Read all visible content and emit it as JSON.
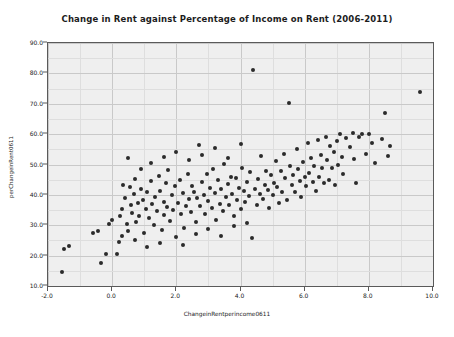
{
  "chart_data": {
    "type": "scatter",
    "title": "Change in Rent against Percentage of Income on Rent (2006-2011)",
    "xlabel": "ChangeinRentperincome0611",
    "ylabel": "perChangeinRent0611",
    "xlim": [
      -2.0,
      10.0
    ],
    "ylim": [
      10.0,
      90.0
    ],
    "xticks": [
      "-2.0",
      "0.0",
      "2.0",
      "4.0",
      "6.0",
      "8.0",
      "10.0"
    ],
    "xtick_values": [
      -2.0,
      0.0,
      2.0,
      4.0,
      6.0,
      8.0,
      10.0
    ],
    "yticks": [
      "10.0",
      "20.0",
      "30.0",
      "40.0",
      "50.0",
      "60.0",
      "70.0",
      "80.0",
      "90.0"
    ],
    "ytick_values": [
      10.0,
      20.0,
      30.0,
      40.0,
      50.0,
      60.0,
      70.0,
      80.0,
      90.0
    ],
    "x_minor_step": 1.0,
    "y_minor_step": 5.0,
    "grid": true,
    "legend": "none",
    "marker_color": "#2b2b2b",
    "plot_background": "#efefef",
    "figure_background": "#ffffff",
    "points": [
      [
        -1.55,
        14.6
      ],
      [
        -1.5,
        22.3
      ],
      [
        -1.35,
        23.2
      ],
      [
        -0.6,
        27.4
      ],
      [
        -0.45,
        28.0
      ],
      [
        -0.35,
        17.6
      ],
      [
        -0.2,
        20.6
      ],
      [
        -0.1,
        30.5
      ],
      [
        0.0,
        31.8
      ],
      [
        0.15,
        20.6
      ],
      [
        0.2,
        24.4
      ],
      [
        0.25,
        33.2
      ],
      [
        0.3,
        35.5
      ],
      [
        0.35,
        43.2
      ],
      [
        0.4,
        38.9
      ],
      [
        0.45,
        30.3
      ],
      [
        0.5,
        28.2
      ],
      [
        0.55,
        42.6
      ],
      [
        0.6,
        36.6
      ],
      [
        0.62,
        34.0
      ],
      [
        0.68,
        40.2
      ],
      [
        0.7,
        45.3
      ],
      [
        0.75,
        31.2
      ],
      [
        0.8,
        37.4
      ],
      [
        0.85,
        33.0
      ],
      [
        0.9,
        42.0
      ],
      [
        0.95,
        38.2
      ],
      [
        1.0,
        27.6
      ],
      [
        1.05,
        35.2
      ],
      [
        1.1,
        40.8
      ],
      [
        1.15,
        32.3
      ],
      [
        1.2,
        44.6
      ],
      [
        1.25,
        36.9
      ],
      [
        1.3,
        30.0
      ],
      [
        1.35,
        39.4
      ],
      [
        1.4,
        34.6
      ],
      [
        1.45,
        46.2
      ],
      [
        1.5,
        41.2
      ],
      [
        1.55,
        28.6
      ],
      [
        1.6,
        37.8
      ],
      [
        1.62,
        33.4
      ],
      [
        1.68,
        43.8
      ],
      [
        1.7,
        36.0
      ],
      [
        1.75,
        48.2
      ],
      [
        1.8,
        31.5
      ],
      [
        1.85,
        39.9
      ],
      [
        1.9,
        35.0
      ],
      [
        1.95,
        42.8
      ],
      [
        2.0,
        26.0
      ],
      [
        2.05,
        37.2
      ],
      [
        2.1,
        45.0
      ],
      [
        2.15,
        33.8
      ],
      [
        2.2,
        40.5
      ],
      [
        2.25,
        29.2
      ],
      [
        2.3,
        36.4
      ],
      [
        2.35,
        47.0
      ],
      [
        2.4,
        38.6
      ],
      [
        2.45,
        34.2
      ],
      [
        2.5,
        43.0
      ],
      [
        2.55,
        41.0
      ],
      [
        2.6,
        31.0
      ],
      [
        2.65,
        39.0
      ],
      [
        2.7,
        56.5
      ],
      [
        2.75,
        36.2
      ],
      [
        2.8,
        44.2
      ],
      [
        2.85,
        40.0
      ],
      [
        2.9,
        33.6
      ],
      [
        2.95,
        46.8
      ],
      [
        3.0,
        38.0
      ],
      [
        3.05,
        42.2
      ],
      [
        3.1,
        35.6
      ],
      [
        3.15,
        48.6
      ],
      [
        3.2,
        40.6
      ],
      [
        3.25,
        31.8
      ],
      [
        3.3,
        44.8
      ],
      [
        3.35,
        37.0
      ],
      [
        3.4,
        41.8
      ],
      [
        3.45,
        34.8
      ],
      [
        3.5,
        50.2
      ],
      [
        3.55,
        39.2
      ],
      [
        3.6,
        43.6
      ],
      [
        3.65,
        36.8
      ],
      [
        3.7,
        46.0
      ],
      [
        3.75,
        40.4
      ],
      [
        3.8,
        33.2
      ],
      [
        3.85,
        45.6
      ],
      [
        3.9,
        38.4
      ],
      [
        3.95,
        42.4
      ],
      [
        4.0,
        35.4
      ],
      [
        4.05,
        49.0
      ],
      [
        4.1,
        41.4
      ],
      [
        4.15,
        37.6
      ],
      [
        4.2,
        44.4
      ],
      [
        4.25,
        39.6
      ],
      [
        4.3,
        47.4
      ],
      [
        4.35,
        25.8
      ],
      [
        4.4,
        81.0
      ],
      [
        4.45,
        42.0
      ],
      [
        4.5,
        36.6
      ],
      [
        4.55,
        45.2
      ],
      [
        4.6,
        40.2
      ],
      [
        4.65,
        52.8
      ],
      [
        4.7,
        38.8
      ],
      [
        4.75,
        43.4
      ],
      [
        4.8,
        48.0
      ],
      [
        4.85,
        41.6
      ],
      [
        4.9,
        35.8
      ],
      [
        4.95,
        46.4
      ],
      [
        5.0,
        39.8
      ],
      [
        5.05,
        44.0
      ],
      [
        5.1,
        51.0
      ],
      [
        5.15,
        42.6
      ],
      [
        5.2,
        37.2
      ],
      [
        5.25,
        47.8
      ],
      [
        5.3,
        40.8
      ],
      [
        5.35,
        53.6
      ],
      [
        5.4,
        45.4
      ],
      [
        5.45,
        38.2
      ],
      [
        5.5,
        70.2
      ],
      [
        5.55,
        49.6
      ],
      [
        5.6,
        43.2
      ],
      [
        5.65,
        46.6
      ],
      [
        5.7,
        41.0
      ],
      [
        5.75,
        55.0
      ],
      [
        5.8,
        48.4
      ],
      [
        5.85,
        44.6
      ],
      [
        5.9,
        39.4
      ],
      [
        5.95,
        50.8
      ],
      [
        6.0,
        45.8
      ],
      [
        6.05,
        42.8
      ],
      [
        6.1,
        57.2
      ],
      [
        6.15,
        47.2
      ],
      [
        6.2,
        52.0
      ],
      [
        6.25,
        44.2
      ],
      [
        6.3,
        49.4
      ],
      [
        6.35,
        41.2
      ],
      [
        6.4,
        58.0
      ],
      [
        6.45,
        46.0
      ],
      [
        6.5,
        53.0
      ],
      [
        6.55,
        48.8
      ],
      [
        6.6,
        43.8
      ],
      [
        6.65,
        59.2
      ],
      [
        6.7,
        51.4
      ],
      [
        6.75,
        45.0
      ],
      [
        6.8,
        56.0
      ],
      [
        6.85,
        49.0
      ],
      [
        6.9,
        54.2
      ],
      [
        6.95,
        43.4
      ],
      [
        7.0,
        57.8
      ],
      [
        7.05,
        50.0
      ],
      [
        7.1,
        60.0
      ],
      [
        7.15,
        52.6
      ],
      [
        7.2,
        46.8
      ],
      [
        7.3,
        58.6
      ],
      [
        7.4,
        55.6
      ],
      [
        7.5,
        60.4
      ],
      [
        7.55,
        51.8
      ],
      [
        7.6,
        44.0
      ],
      [
        7.7,
        59.0
      ],
      [
        7.8,
        60.2
      ],
      [
        7.9,
        53.4
      ],
      [
        8.0,
        60.0
      ],
      [
        8.1,
        57.0
      ],
      [
        8.2,
        50.6
      ],
      [
        8.4,
        58.4
      ],
      [
        8.5,
        67.0
      ],
      [
        8.6,
        52.8
      ],
      [
        8.65,
        56.2
      ],
      [
        9.6,
        74.0
      ],
      [
        0.5,
        52.0
      ],
      [
        0.9,
        48.6
      ],
      [
        1.2,
        50.4
      ],
      [
        1.6,
        52.4
      ],
      [
        2.0,
        54.0
      ],
      [
        2.4,
        51.6
      ],
      [
        2.8,
        53.2
      ],
      [
        3.2,
        55.4
      ],
      [
        3.6,
        52.2
      ],
      [
        4.0,
        56.8
      ],
      [
        1.1,
        22.8
      ],
      [
        1.5,
        24.2
      ],
      [
        2.2,
        23.6
      ],
      [
        2.6,
        27.0
      ],
      [
        3.0,
        28.8
      ],
      [
        3.4,
        26.4
      ],
      [
        3.8,
        29.6
      ],
      [
        4.2,
        30.8
      ],
      [
        0.3,
        26.6
      ],
      [
        0.7,
        25.2
      ]
    ]
  }
}
